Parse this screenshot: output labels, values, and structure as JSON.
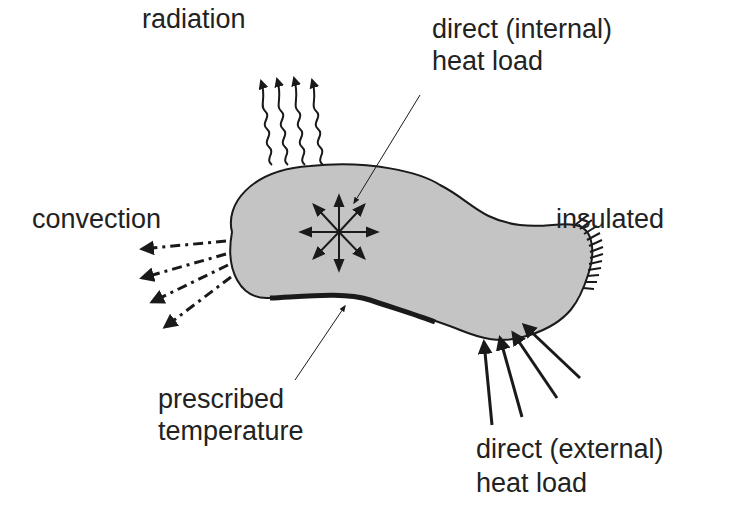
{
  "diagram": {
    "labels": {
      "radiation": "radiation",
      "internal_line1": "direct (internal)",
      "internal_line2": "heat load",
      "convection": "convection",
      "insulated": "insulated",
      "prescribed_line1": "prescribed",
      "prescribed_line2": "temperature",
      "external_line1": "direct (external)",
      "external_line2": "heat load"
    },
    "colors": {
      "body_fill": "#c4c4c4",
      "stroke": "#1a1a1a",
      "text": "#222222"
    }
  }
}
